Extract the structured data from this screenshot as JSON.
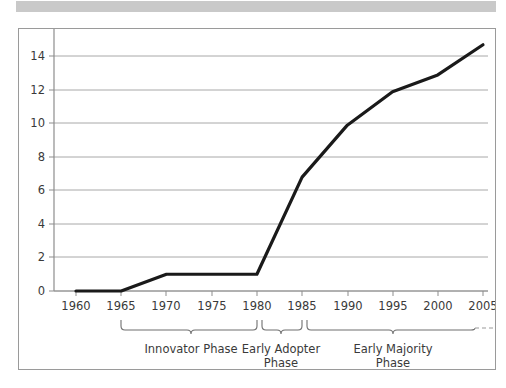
{
  "chart_data": {
    "type": "line",
    "title": "",
    "xlabel": "",
    "ylabel": "",
    "x": [
      1960,
      1965,
      1970,
      1975,
      1980,
      1985,
      1990,
      1995,
      2000,
      2005
    ],
    "values": [
      0,
      0,
      1,
      1,
      1,
      6.8,
      9.9,
      11.9,
      12.9,
      14.7
    ],
    "series": [
      {
        "name": "adoption",
        "values": [
          0,
          0,
          1,
          1,
          1,
          6.8,
          9.9,
          11.9,
          12.9,
          14.7
        ]
      }
    ],
    "xlim": [
      1958,
      2007
    ],
    "ylim": [
      0,
      16
    ],
    "ytick_labels": [
      "0",
      "2",
      "4",
      "6",
      "8",
      "10",
      "12",
      "14",
      "16"
    ],
    "ytick_values": [
      0,
      2,
      4,
      6,
      8,
      10,
      12,
      14,
      16
    ],
    "xtick_labels": [
      "1960",
      "1965",
      "1970",
      "1975",
      "1980",
      "1985",
      "1990",
      "1995",
      "2000",
      "2005"
    ],
    "xtick_values": [
      1960,
      1965,
      1970,
      1975,
      1980,
      1985,
      1990,
      1995,
      2000,
      2005
    ],
    "grid": true,
    "legend": false,
    "line_color": "#1a1a1a",
    "grid_color": "#a8a8a8",
    "annotations": [
      {
        "id": "innovator",
        "label_line1": "Innovator Phase",
        "label_line2": "",
        "span_start": 1965,
        "span_end": 1980
      },
      {
        "id": "early-adopter",
        "label_line1": "Early Adopter",
        "label_line2": "Phase",
        "span_start": 1980,
        "span_end": 1985
      },
      {
        "id": "early-majority",
        "label_line1": "Early Majority",
        "label_line2": "Phase",
        "span_start": 1985,
        "span_end": 2008
      }
    ]
  },
  "ytick": {
    "t0": "0",
    "t1": "2",
    "t2": "4",
    "t3": "6",
    "t4": "8",
    "t5": "10",
    "t6": "12",
    "t7": "14",
    "t8": "16"
  },
  "xtick": {
    "t0": "1960",
    "t1": "1965",
    "t2": "1970",
    "t3": "1975",
    "t4": "1980",
    "t5": "1985",
    "t6": "1990",
    "t7": "1995",
    "t8": "2000",
    "t9": "2005"
  },
  "phases": {
    "innovator_line1": "Innovator Phase",
    "adopter_line1": "Early Adopter",
    "adopter_line2": "Phase",
    "majority_line1": "Early Majority",
    "majority_line2": "Phase"
  }
}
